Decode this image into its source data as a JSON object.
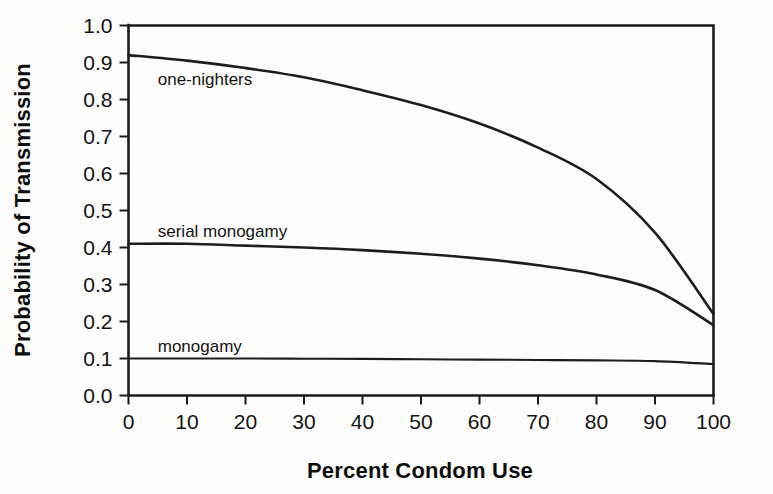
{
  "chart_data": {
    "type": "line",
    "title": "",
    "xlabel": "Percent Condom Use",
    "ylabel": "Probability of Transmission",
    "xlim": [
      0,
      100
    ],
    "ylim": [
      0.0,
      1.0
    ],
    "grid": false,
    "legend_position": "inline-annotations",
    "x": [
      0,
      10,
      20,
      30,
      40,
      50,
      60,
      70,
      80,
      90,
      100
    ],
    "xticklabels": [
      "0",
      "10",
      "20",
      "30",
      "40",
      "50",
      "60",
      "70",
      "80",
      "90",
      "100"
    ],
    "yticks": [
      0.0,
      0.1,
      0.2,
      0.3,
      0.4,
      0.5,
      0.6,
      0.7,
      0.8,
      0.9,
      1.0
    ],
    "yticklabels": [
      "0.0",
      "0.1",
      "0.2",
      "0.3",
      "0.4",
      "0.5",
      "0.6",
      "0.7",
      "0.8",
      "0.9",
      "1.0"
    ],
    "series": [
      {
        "name": "one-nighters",
        "label": "one-nighters",
        "color": "#1d1d1d",
        "values": [
          0.92,
          0.905,
          0.885,
          0.86,
          0.825,
          0.785,
          0.735,
          0.67,
          0.585,
          0.44,
          0.22
        ]
      },
      {
        "name": "serial monogamy",
        "label": "serial monogamy",
        "color": "#1d1d1d",
        "values": [
          0.41,
          0.41,
          0.405,
          0.4,
          0.393,
          0.383,
          0.37,
          0.352,
          0.327,
          0.285,
          0.19
        ]
      },
      {
        "name": "monogamy",
        "label": "monogamy",
        "color": "#1d1d1d",
        "values": [
          0.1,
          0.1,
          0.1,
          0.0995,
          0.099,
          0.098,
          0.097,
          0.096,
          0.095,
          0.093,
          0.085
        ]
      }
    ],
    "annotations": [
      {
        "text": "one-nighters",
        "x": 5,
        "y": 0.855
      },
      {
        "text": "serial monogamy",
        "x": 5,
        "y": 0.445
      },
      {
        "text": "monogamy",
        "x": 5,
        "y": 0.135
      }
    ],
    "colors": {
      "ink": "#1d1d1d",
      "background": "#fdfdfb",
      "text": "#121212"
    }
  }
}
